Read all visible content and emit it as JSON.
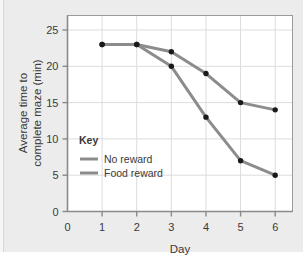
{
  "chart_data": {
    "type": "line",
    "title": "",
    "xlabel": "Day",
    "ylabel_line1": "Average time to",
    "ylabel_line2": "complete maze (min)",
    "ylabel": "Average time to complete maze (min)",
    "x": [
      1,
      2,
      3,
      4,
      5,
      6
    ],
    "xticks": [
      "0",
      "1",
      "2",
      "3",
      "4",
      "5",
      "6"
    ],
    "xtick_values": [
      0,
      1,
      2,
      3,
      4,
      5,
      6
    ],
    "yticks": [
      "0",
      "5",
      "10",
      "15",
      "20",
      "25"
    ],
    "ytick_values": [
      0,
      5,
      10,
      15,
      20,
      25
    ],
    "xlim": [
      0,
      6.5
    ],
    "ylim": [
      0,
      27
    ],
    "grid": true,
    "legend_position": "inside-left",
    "legend_title": "Key",
    "series": [
      {
        "name": "No reward",
        "values": [
          23,
          23,
          22,
          19,
          15,
          14
        ],
        "color": "#8c8c8c",
        "marker": "circle",
        "marker_color": "#1a1a1a"
      },
      {
        "name": "Food reward",
        "values": [
          23,
          23,
          20,
          13,
          7,
          5
        ],
        "color": "#8c8c8c",
        "marker": "circle",
        "marker_color": "#1a1a1a"
      }
    ]
  },
  "colors": {
    "page_background": "#ececec",
    "plot_background": "#ffffff",
    "axis": "#8a8a8a",
    "grid": "#dcdcdc",
    "text": "#3a3a3a",
    "line": "#8c8c8c",
    "marker": "#1a1a1a"
  }
}
